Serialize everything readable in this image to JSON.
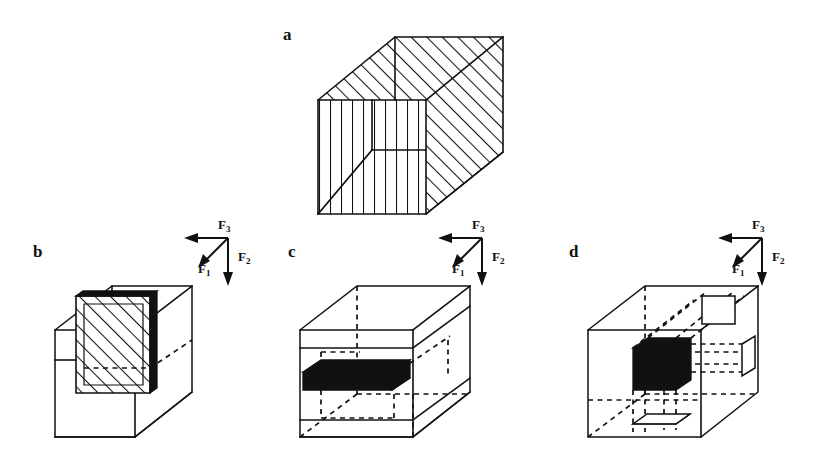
{
  "figure": {
    "background_color": "#ffffff",
    "ink_color": "#111111",
    "width": 824,
    "height": 470,
    "panels": [
      {
        "id": "a",
        "label": "a",
        "label_x": 283,
        "label_y": 26,
        "description": "Isometric cube with fully hatched faces: diagonal hatching on top and right faces, vertical hatching on front face",
        "has_force_triad": false,
        "fill_style": "hatched-all-faces"
      },
      {
        "id": "b",
        "label": "b",
        "label_x": 33,
        "label_y": 243,
        "description": "Wireframe cube containing an internal diagonally hatched plane with a bold leading edge",
        "has_force_triad": true,
        "fill_style": "hatched-internal-plane"
      },
      {
        "id": "c",
        "label": "c",
        "label_x": 288,
        "label_y": 243,
        "description": "Wireframe cube with dashed hidden edges containing a solid black horizontal slab",
        "has_force_triad": true,
        "fill_style": "solid-black-slab"
      },
      {
        "id": "d",
        "label": "d",
        "label_x": 569,
        "label_y": 243,
        "description": "Wireframe cube with dashed hidden edges containing a solid black cube and small projected square outlines on the top and side faces",
        "has_force_triad": true,
        "fill_style": "solid-black-cube-with-projections"
      }
    ]
  },
  "force_triads": [
    {
      "panel": "b",
      "origin_x": 228,
      "origin_y": 238,
      "forces": [
        {
          "name": "F1",
          "symbol": "F",
          "subscript": "1",
          "label_x": 198,
          "label_y": 262,
          "direction": "down-left-diagonal"
        },
        {
          "name": "F2",
          "symbol": "F",
          "subscript": "2",
          "label_x": 238,
          "label_y": 250,
          "direction": "down"
        },
        {
          "name": "F3",
          "symbol": "F",
          "subscript": "3",
          "label_x": 218,
          "label_y": 218,
          "direction": "left"
        }
      ]
    },
    {
      "panel": "c",
      "origin_x": 482,
      "origin_y": 238,
      "forces": [
        {
          "name": "F1",
          "symbol": "F",
          "subscript": "1",
          "label_x": 452,
          "label_y": 262,
          "direction": "down-left-diagonal"
        },
        {
          "name": "F2",
          "symbol": "F",
          "subscript": "2",
          "label_x": 492,
          "label_y": 250,
          "direction": "down"
        },
        {
          "name": "F3",
          "symbol": "F",
          "subscript": "3",
          "label_x": 472,
          "label_y": 218,
          "direction": "left"
        }
      ]
    },
    {
      "panel": "d",
      "origin_x": 762,
      "origin_y": 238,
      "forces": [
        {
          "name": "F1",
          "symbol": "F",
          "subscript": "1",
          "label_x": 732,
          "label_y": 262,
          "direction": "down-left-diagonal"
        },
        {
          "name": "F2",
          "symbol": "F",
          "subscript": "2",
          "label_x": 772,
          "label_y": 250,
          "direction": "down"
        },
        {
          "name": "F3",
          "symbol": "F",
          "subscript": "3",
          "label_x": 752,
          "label_y": 218,
          "direction": "left"
        }
      ]
    }
  ]
}
